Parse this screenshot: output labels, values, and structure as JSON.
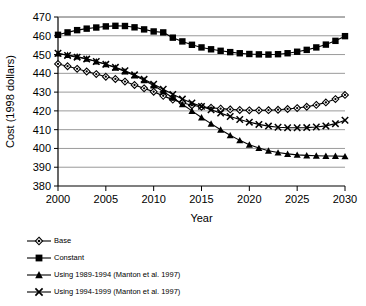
{
  "chart_data": {
    "type": "line",
    "title": "",
    "xlabel": "Year",
    "ylabel": "Cost (1998 dollars)",
    "xlim": [
      2000,
      2030
    ],
    "ylim": [
      380,
      470
    ],
    "yticks": [
      380,
      390,
      400,
      410,
      420,
      430,
      440,
      450,
      460,
      470
    ],
    "xticks": [
      2000,
      2005,
      2010,
      2015,
      2020,
      2025,
      2030
    ],
    "grid": "horizontal",
    "legend_position": "below",
    "x": [
      2000,
      2001,
      2002,
      2003,
      2004,
      2005,
      2006,
      2007,
      2008,
      2009,
      2010,
      2011,
      2012,
      2013,
      2014,
      2015,
      2016,
      2017,
      2018,
      2019,
      2020,
      2021,
      2022,
      2023,
      2024,
      2025,
      2026,
      2027,
      2028,
      2029,
      2030
    ],
    "series": [
      {
        "name": "Base",
        "marker": "diamond-open",
        "values": [
          445.0,
          443.8,
          442.4,
          441.0,
          439.6,
          438.2,
          437.0,
          435.6,
          433.8,
          432.0,
          430.2,
          428.0,
          426.0,
          424.3,
          423.0,
          422.2,
          421.7,
          421.2,
          420.8,
          420.5,
          420.3,
          420.3,
          420.4,
          420.6,
          421.0,
          421.5,
          422.2,
          423.2,
          424.5,
          426.3,
          428.5
        ]
      },
      {
        "name": "Constant",
        "marker": "square-filled",
        "values": [
          460.5,
          461.8,
          463.0,
          463.8,
          464.4,
          465.0,
          465.3,
          465.2,
          464.5,
          463.4,
          462.3,
          461.8,
          459.0,
          457.0,
          455.2,
          453.8,
          452.8,
          452.0,
          451.3,
          450.7,
          450.3,
          450.1,
          450.0,
          450.2,
          450.7,
          451.5,
          452.5,
          453.8,
          455.3,
          457.3,
          459.8
        ]
      },
      {
        "name": "Using 1989-1994 (Manton et al. 1997)",
        "marker": "triangle-filled",
        "values": [
          450.5,
          449.8,
          449.0,
          447.8,
          446.3,
          444.8,
          443.0,
          441.0,
          438.8,
          436.3,
          433.5,
          430.3,
          427.0,
          423.5,
          420.0,
          416.5,
          413.2,
          410.0,
          407.0,
          404.3,
          402.0,
          400.2,
          398.8,
          397.8,
          397.1,
          396.6,
          396.3,
          396.1,
          396.0,
          396.0,
          395.8
        ]
      },
      {
        "name": "Using 1994-1999 (Manton et al. 1997)",
        "marker": "x",
        "values": [
          450.7,
          449.5,
          448.6,
          447.6,
          446.3,
          444.8,
          443.2,
          441.4,
          439.2,
          436.8,
          434.2,
          431.5,
          428.8,
          426.3,
          424.2,
          422.4,
          420.6,
          418.8,
          417.0,
          415.4,
          414.0,
          412.8,
          411.9,
          411.3,
          411.0,
          411.0,
          411.1,
          411.4,
          412.0,
          413.2,
          415.0
        ]
      }
    ]
  },
  "legend": {
    "items": [
      {
        "label": "Base"
      },
      {
        "label": "Constant"
      },
      {
        "label": "Using 1989-1994 (Manton et al. 1997)"
      },
      {
        "label": "Using 1994-1999 (Manton et al. 1997)"
      }
    ]
  },
  "colors": {
    "line": "#000000",
    "grid": "#808080",
    "axis": "#000000",
    "background": "#ffffff"
  }
}
